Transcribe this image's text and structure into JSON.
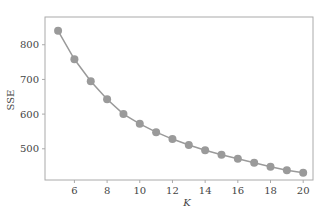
{
  "chart_data": {
    "type": "line",
    "title": "",
    "xlabel": "K",
    "ylabel": "SSE",
    "x": [
      5,
      6,
      7,
      8,
      9,
      10,
      11,
      12,
      13,
      14,
      15,
      16,
      17,
      18,
      19,
      20
    ],
    "series": [
      {
        "name": "SSE",
        "values": [
          840,
          758,
          695,
          643,
          600,
          572,
          548,
          528,
          511,
          496,
          483,
          471,
          460,
          448,
          438,
          431
        ]
      }
    ],
    "xticks": [
      6,
      8,
      10,
      12,
      14,
      16,
      18,
      20
    ],
    "yticks": [
      500,
      600,
      700,
      800
    ],
    "xlim": [
      4.2,
      20.6
    ],
    "ylim": [
      410,
      880
    ],
    "grid": false,
    "legend": null,
    "colors": {
      "line": "#9a9a9a",
      "marker": "#9a9a9a",
      "frame": "#aaaaaa"
    }
  }
}
